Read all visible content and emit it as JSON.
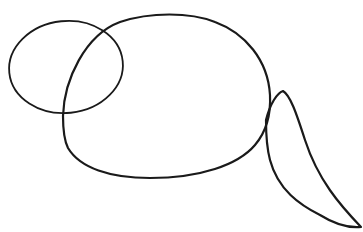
{
  "drawing": {
    "subject": "rodent construction sketch",
    "stroke_color": "#1a1a1a",
    "background": "#ffffff",
    "shapes": [
      {
        "name": "head-circle",
        "type": "ellipse"
      },
      {
        "name": "body-oval",
        "type": "curve"
      },
      {
        "name": "tail",
        "type": "curve"
      }
    ]
  }
}
